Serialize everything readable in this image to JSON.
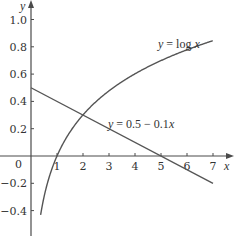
{
  "chart_data": {
    "type": "line",
    "title": "",
    "xlabel": "x",
    "ylabel": "y",
    "xlim": [
      0,
      7.5
    ],
    "ylim": [
      -0.6,
      1.1
    ],
    "grid": false,
    "legend": null,
    "x_ticks": [
      1,
      2,
      3,
      4,
      5,
      6,
      7
    ],
    "x_tick_labels": [
      "1",
      "2",
      "3",
      "4",
      "5",
      "6",
      "7"
    ],
    "y_ticks": [
      -0.4,
      -0.2,
      0,
      0.2,
      0.4,
      0.6,
      0.8,
      1.0
    ],
    "y_tick_labels": [
      "−0.4",
      "−0.2",
      "0",
      "0.2",
      "0.4",
      "0.6",
      "0.8",
      "1.0"
    ],
    "series": [
      {
        "name": "y = log x",
        "function": "log10(x)",
        "x": [
          0.38,
          0.5,
          1,
          1.5,
          2,
          2.5,
          3,
          4,
          5,
          6,
          7
        ],
        "values": [
          -0.42,
          -0.301,
          0,
          0.176,
          0.301,
          0.398,
          0.477,
          0.602,
          0.699,
          0.778,
          0.845
        ]
      },
      {
        "name": "y = 0.5 − 0.1x",
        "function": "0.5 - 0.1*x",
        "x": [
          0,
          1,
          2,
          3,
          4,
          5,
          6,
          7
        ],
        "values": [
          0.5,
          0.4,
          0.3,
          0.2,
          0.1,
          0.0,
          -0.1,
          -0.2
        ]
      }
    ],
    "annotations": [
      {
        "text": "y = log x",
        "x": 5.0,
        "y": 0.85
      },
      {
        "text": "y = 0.5 − 0.1x",
        "x": 2.2,
        "y": 0.27
      }
    ],
    "intersection_approx": {
      "x": 2.0,
      "y": 0.3
    }
  },
  "labels": {
    "x_axis": "x",
    "y_axis": "y",
    "origin": "0",
    "log_curve": "y = log x",
    "line_curve": "y = 0.5 − 0.1x"
  },
  "colors": {
    "axis": "#4a4a4a",
    "curve": "#555555",
    "text": "#333333",
    "background": "#ffffff"
  }
}
